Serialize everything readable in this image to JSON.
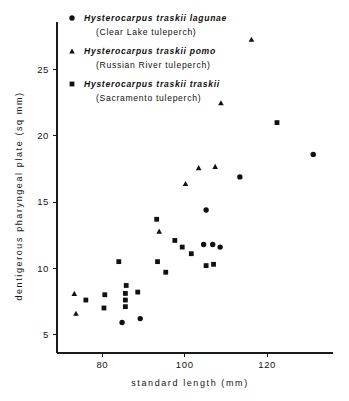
{
  "figure": {
    "background": "#ffffff",
    "ink_color": "#111111"
  },
  "legend": {
    "entries": [
      {
        "marker": "circle-marker",
        "scientific_name": "Hysterocarpus traskii lagunae",
        "common_name": "(Clear Lake tuleperch)"
      },
      {
        "marker": "triangle-marker",
        "scientific_name": "Hysterocarpus traskii pomo",
        "common_name": "(Russian River tuleperch)"
      },
      {
        "marker": "square-marker",
        "scientific_name": "Hysterocarpus traskii traskii",
        "common_name": "(Sacramento tuleperch)"
      }
    ]
  },
  "chart_data": {
    "type": "scatter",
    "title": "",
    "xlabel": "standard length (mm)",
    "ylabel": "dentigerous pharyngeal plate (sq mm)",
    "xlim": [
      69,
      136
    ],
    "ylim": [
      3.6,
      28.6
    ],
    "xticks": [
      80,
      100,
      120
    ],
    "yticks": [
      5,
      10,
      15,
      20,
      25
    ],
    "xtick_labels": [
      "80",
      "100",
      "120"
    ],
    "ytick_labels": [
      "5",
      "10",
      "15",
      "20",
      "25"
    ],
    "grid": false,
    "legend_position": "top-left",
    "series": [
      {
        "name": "Hysterocarpus traskii lagunae",
        "common_name": "Clear Lake tuleperch",
        "marker": "circle",
        "points": [
          [
            84.8,
            5.9
          ],
          [
            89.2,
            6.2
          ],
          [
            105.2,
            14.4
          ],
          [
            104.6,
            11.8
          ],
          [
            106.8,
            11.8
          ],
          [
            108.6,
            11.6
          ],
          [
            113.4,
            16.9
          ],
          [
            131.2,
            18.6
          ]
        ]
      },
      {
        "name": "Hysterocarpus traskii pomo",
        "common_name": "Russian River tuleperch",
        "marker": "triangle",
        "points": [
          [
            73.2,
            8.1
          ],
          [
            73.6,
            6.6
          ],
          [
            93.8,
            12.8
          ],
          [
            100.2,
            16.4
          ],
          [
            103.4,
            17.6
          ],
          [
            107.4,
            17.7
          ],
          [
            108.8,
            22.5
          ],
          [
            116.2,
            27.3
          ]
        ]
      },
      {
        "name": "Hysterocarpus traskii traskii",
        "common_name": "Sacramento tuleperch",
        "marker": "square",
        "points": [
          [
            76.0,
            7.6
          ],
          [
            80.4,
            7.0
          ],
          [
            80.6,
            8.0
          ],
          [
            84.0,
            10.5
          ],
          [
            85.6,
            8.1
          ],
          [
            85.6,
            7.6
          ],
          [
            85.6,
            7.1
          ],
          [
            85.8,
            8.7
          ],
          [
            88.6,
            8.2
          ],
          [
            93.2,
            13.7
          ],
          [
            93.4,
            10.5
          ],
          [
            95.4,
            9.7
          ],
          [
            97.6,
            12.1
          ],
          [
            99.4,
            11.6
          ],
          [
            101.6,
            11.1
          ],
          [
            105.2,
            10.2
          ],
          [
            107.0,
            10.3
          ],
          [
            122.4,
            21.0
          ]
        ]
      }
    ]
  }
}
